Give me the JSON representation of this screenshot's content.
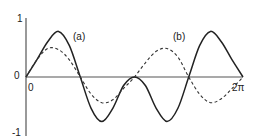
{
  "chart_data": {
    "type": "line",
    "title": "",
    "xlabel": "",
    "ylabel": "",
    "xlim": [
      0,
      6.2832
    ],
    "ylim": [
      -1,
      1
    ],
    "grid": false,
    "legend": "inline annotations",
    "x_tick_labels": [
      "0",
      "2π"
    ],
    "y_tick_labels": [
      "1",
      "0",
      "-1"
    ],
    "annotations": [
      "(a)",
      "(b)"
    ],
    "series": [
      {
        "name": "solid",
        "style": "solid",
        "x": [
          0,
          0.314,
          0.628,
          0.942,
          1.257,
          1.571,
          1.885,
          2.199,
          2.513,
          2.827,
          3.142,
          3.456,
          3.77,
          4.084,
          4.398,
          4.712,
          5.027,
          5.341,
          5.655,
          5.969,
          6.283
        ],
        "values": [
          0,
          0.3,
          0.62,
          0.8,
          0.55,
          0.0,
          -0.55,
          -0.78,
          -0.55,
          -0.15,
          0.0,
          -0.15,
          -0.55,
          -0.78,
          -0.55,
          0.0,
          0.55,
          0.8,
          0.62,
          0.3,
          0
        ]
      },
      {
        "name": "dashed",
        "style": "dashed",
        "x": [
          0,
          0.314,
          0.628,
          0.942,
          1.257,
          1.571,
          1.885,
          2.199,
          2.513,
          2.827,
          3.142,
          3.456,
          3.77,
          4.084,
          4.398,
          4.712,
          5.027,
          5.341,
          5.655,
          5.969,
          6.283
        ],
        "values": [
          0,
          0.3,
          0.5,
          0.48,
          0.3,
          0.0,
          -0.3,
          -0.45,
          -0.4,
          -0.2,
          0.0,
          0.25,
          0.45,
          0.5,
          0.35,
          0.0,
          -0.3,
          -0.45,
          -0.38,
          -0.2,
          0
        ]
      }
    ]
  },
  "labels": {
    "y_top": "1",
    "y_zero": "0",
    "y_bottom": "-1",
    "x_zero": "0",
    "x_end": "2π",
    "annot_a": "(a)",
    "annot_b": "(b)"
  }
}
